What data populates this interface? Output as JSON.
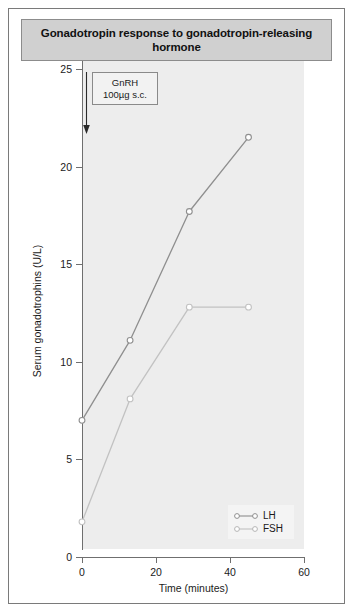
{
  "figure": {
    "title": "Gonadotropin response to gonadotropin-releasing hormone"
  },
  "annotation": {
    "line1": "GnRH",
    "line2": "100µg s.c.",
    "arrow_icon": "down-arrow-icon"
  },
  "legend": {
    "position": "bottom-right",
    "items": [
      {
        "label": "LH",
        "color": "#8f8f8f"
      },
      {
        "label": "FSH",
        "color": "#c2c2c2"
      }
    ]
  },
  "colors": {
    "plot_background": "#ededed",
    "axis": "#6f6f6f",
    "title_background": "#d0d0d0",
    "frame_border": "#7a7a7a",
    "lh_line": "#8f8f8f",
    "fsh_line": "#c2c2c2",
    "marker_fill": "#ffffff"
  },
  "chart_data": {
    "type": "line",
    "title": "Gonadotropin response to gonadotropin-releasing hormone",
    "xlabel": "Time (minutes)",
    "ylabel": "Serum gonadotrophins (U/L)",
    "xlim": [
      0,
      60
    ],
    "ylim": [
      0,
      25
    ],
    "xticks": [
      0,
      20,
      40,
      60
    ],
    "yticks": [
      0,
      5,
      10,
      15,
      20,
      25
    ],
    "xtick_labels": [
      "0",
      "20",
      "40",
      "60"
    ],
    "ytick_labels": [
      "0",
      "5",
      "10",
      "15",
      "20",
      "25"
    ],
    "grid": false,
    "legend_position": "bottom-right",
    "annotations": [
      {
        "text": "GnRH 100µg s.c.",
        "x": 0,
        "y": 25,
        "arrow": "down"
      }
    ],
    "series": [
      {
        "name": "LH",
        "color": "#8f8f8f",
        "marker": "circle-open",
        "x": [
          0,
          13,
          29,
          45
        ],
        "y": [
          7.0,
          11.1,
          17.7,
          21.5
        ]
      },
      {
        "name": "FSH",
        "color": "#c2c2c2",
        "marker": "circle-open",
        "x": [
          0,
          13,
          29,
          45
        ],
        "y": [
          1.8,
          8.1,
          12.8,
          12.8
        ]
      }
    ]
  }
}
